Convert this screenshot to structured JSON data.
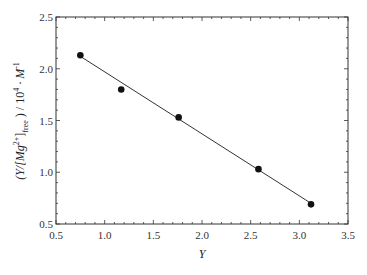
{
  "chart_data": {
    "type": "scatter",
    "title": "",
    "xlabel": "Y",
    "ylabel": "(Y/[Mg2+]free) / 10^4 · M^-1",
    "xlim": [
      0.5,
      3.5
    ],
    "ylim": [
      0.5,
      2.5
    ],
    "x_ticks": [
      "0.5",
      "1.0",
      "1.5",
      "2.0",
      "2.5",
      "3.0",
      "3.5"
    ],
    "y_ticks": [
      "0.5",
      "1.0",
      "1.5",
      "2.0",
      "2.5"
    ],
    "grid": false,
    "legend": null,
    "series": [
      {
        "name": "data",
        "type": "scatter",
        "marker": "filled-circle",
        "x": [
          0.75,
          1.17,
          1.76,
          2.58,
          3.12
        ],
        "y": [
          2.13,
          1.8,
          1.53,
          1.03,
          0.69
        ]
      },
      {
        "name": "linear fit",
        "type": "line",
        "x": [
          0.75,
          3.12
        ],
        "y": [
          2.12,
          0.7
        ]
      }
    ]
  },
  "labels": {
    "x_axis": "Y",
    "y_axis_main": "(Y/[Mg",
    "y_axis_sup1": "2+",
    "y_axis_mid": "]",
    "y_axis_sub": "free",
    "y_axis_end": " ) / 10",
    "y_axis_sup2": "4",
    "y_axis_tail": " · M",
    "y_axis_sup3": "-1"
  }
}
